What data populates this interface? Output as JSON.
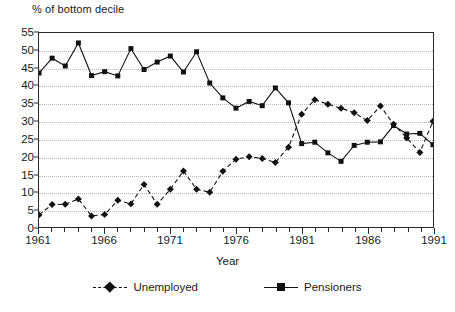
{
  "chart_data": {
    "type": "line",
    "title": "",
    "ylabel": "% of bottom decile",
    "xlabel": "Year",
    "ylim": [
      0,
      55
    ],
    "ytick_step": 5,
    "yticks": [
      0,
      5,
      10,
      15,
      20,
      25,
      30,
      35,
      40,
      45,
      50,
      55
    ],
    "xlim": [
      1961,
      1991
    ],
    "xtick_labels": [
      "1961",
      "1966",
      "1971",
      "1976",
      "1981",
      "1986",
      "1991"
    ],
    "xtick_values": [
      1961,
      1966,
      1971,
      1976,
      1981,
      1986,
      1991
    ],
    "grid": "horizontal-dotted",
    "legend_position": "bottom-center",
    "x": [
      1961,
      1962,
      1963,
      1964,
      1965,
      1966,
      1967,
      1968,
      1969,
      1970,
      1971,
      1972,
      1973,
      1974,
      1975,
      1976,
      1977,
      1978,
      1979,
      1980,
      1981,
      1982,
      1983,
      1984,
      1985,
      1986,
      1987,
      1988,
      1989,
      1990,
      1991
    ],
    "series": [
      {
        "name": "Unemployed",
        "marker": "diamond",
        "line_style": "dashed",
        "color": "#111111",
        "values": [
          3.7,
          6.6,
          6.7,
          8.2,
          3.4,
          3.8,
          7.8,
          6.8,
          12.3,
          6.7,
          10.9,
          16.1,
          10.9,
          10.1,
          16.0,
          19.4,
          20.1,
          19.6,
          18.5,
          22.8,
          32.1,
          36.2,
          34.9,
          33.8,
          32.5,
          30.3,
          34.4,
          29.3,
          25.4,
          21.3,
          30.1
        ]
      },
      {
        "name": "Pensioners",
        "marker": "square",
        "line_style": "solid",
        "color": "#111111",
        "values": [
          43.7,
          47.9,
          45.7,
          52.2,
          43.0,
          44.1,
          42.9,
          50.6,
          44.7,
          46.8,
          48.5,
          44.0,
          49.7,
          40.9,
          36.7,
          33.8,
          35.7,
          34.5,
          39.5,
          35.3,
          23.8,
          24.2,
          21.2,
          18.8,
          23.3,
          24.2,
          24.3,
          28.9,
          26.5,
          26.7,
          23.5
        ]
      }
    ]
  },
  "legend": {
    "items": [
      {
        "label": "Unemployed"
      },
      {
        "label": "Pensioners"
      }
    ]
  }
}
